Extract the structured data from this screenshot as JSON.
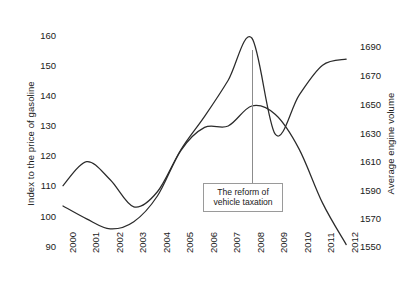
{
  "chart_data": {
    "type": "line",
    "title": "",
    "xlabel": "",
    "categories": [
      "2000",
      "2001",
      "2002",
      "2003",
      "2004",
      "2005",
      "2006",
      "2007",
      "2008",
      "2009",
      "2010",
      "2011",
      "2012"
    ],
    "grid": false,
    "legend": "none",
    "axes": {
      "left": {
        "label": "Index to the price of gasoline",
        "ticks": [
          160,
          150,
          140,
          130,
          120,
          110,
          100,
          90
        ],
        "range": [
          90,
          160
        ]
      },
      "right": {
        "label": "Average engine volume",
        "ticks": [
          1690,
          1670,
          1650,
          1630,
          1610,
          1590,
          1570,
          1550
        ],
        "range": [
          1550,
          1690
        ]
      }
    },
    "series": [
      {
        "name": "Index to the price of gasoline",
        "axis": "left",
        "values": [
          110,
          118,
          112,
          103,
          108,
          122,
          133,
          145,
          159,
          127,
          140,
          150,
          152
        ]
      },
      {
        "name": "Average engine volume",
        "axis": "right",
        "values": [
          1578,
          1569,
          1562,
          1567,
          1585,
          1617,
          1633,
          1634,
          1648,
          1642,
          1618,
          1580,
          1551
        ]
      }
    ],
    "annotations": [
      {
        "name": "reform-annotation",
        "line1": "The reform of",
        "line2": "vehicle taxation",
        "points_to_year": "2008"
      }
    ],
    "colors": {
      "line": "#2b2b2b",
      "background": "#ffffff",
      "text": "#1a1a1a",
      "annotation_border": "#9a9a9a"
    }
  }
}
